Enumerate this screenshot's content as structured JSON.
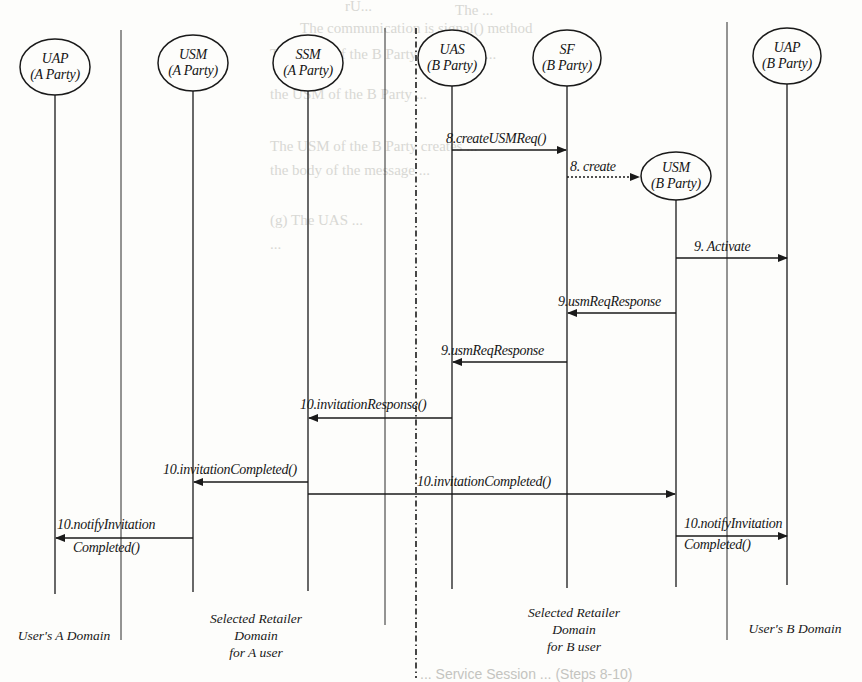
{
  "background_text": {
    "lines": [
      "rU...",
      "The ...",
      "The communication is signal() method",
      "The USM of the B Party can create ...",
      "the USM of the B Party ...",
      "The USM of the B Party creates ...",
      "the body of the message ...",
      "",
      "(g) The UAS ...",
      "..."
    ]
  },
  "actors": [
    {
      "id": "uap-a",
      "name": "UAP",
      "party": "(A Party)"
    },
    {
      "id": "usm-a",
      "name": "USM",
      "party": "(A Party)"
    },
    {
      "id": "ssm-a",
      "name": "SSM",
      "party": "(A Party)"
    },
    {
      "id": "uas-b",
      "name": "UAS",
      "party": "(B Party)"
    },
    {
      "id": "sf-b",
      "name": "SF",
      "party": "(B Party)"
    },
    {
      "id": "usm-b",
      "name": "USM",
      "party": "(B Party)"
    },
    {
      "id": "uap-b",
      "name": "UAP",
      "party": "(B Party)"
    }
  ],
  "messages": [
    {
      "label": "8.createUSMReq()",
      "from": "UAS (B Party)",
      "to": "SF (B Party)",
      "style": "solid"
    },
    {
      "label": "8. create",
      "from": "SF (B Party)",
      "to": "USM (B Party)",
      "style": "dotted"
    },
    {
      "label": "9. Activate",
      "from": "USM (B Party)",
      "to": "UAP (B Party)",
      "style": "solid"
    },
    {
      "label": "9.usmReqResponse",
      "from": "USM (B Party)",
      "to": "SF (B Party)",
      "style": "solid"
    },
    {
      "label": "9.usmReqResponse",
      "from": "SF (B Party)",
      "to": "UAS (B Party)",
      "style": "solid"
    },
    {
      "label": "10.invitationResponse()",
      "from": "UAS (B Party)",
      "to": "SSM (A Party)",
      "style": "solid"
    },
    {
      "label": "10.invitationCompleted()",
      "from": "SSM (A Party)",
      "to": "USM (A Party)",
      "style": "solid"
    },
    {
      "label": "10.invitationCompleted()",
      "from": "SSM (A Party)",
      "to": "USM (B Party)",
      "style": "solid"
    },
    {
      "label_line1": "10.notifyInvitation",
      "label_line2": "Completed()",
      "from": "USM (A Party)",
      "to": "UAP (A Party)",
      "style": "solid"
    },
    {
      "label_line1": "10.notifyInvitation",
      "label_line2": "Completed()",
      "from": "USM (B Party)",
      "to": "UAP (B Party)",
      "style": "solid"
    }
  ],
  "domains": [
    {
      "lines": [
        "User's A Domain"
      ]
    },
    {
      "lines": [
        "Selected Retailer",
        "Domain",
        "for A user"
      ]
    },
    {
      "lines": [
        "Selected Retailer",
        "Domain",
        "for B user"
      ]
    },
    {
      "lines": [
        "User's B Domain"
      ]
    }
  ],
  "caption": "... Service Session ... (Steps 8-10)",
  "colors": {
    "ink": "#1a1a1a",
    "paper": "#fdfdfb",
    "ghost_text": "#d8d8d4"
  }
}
